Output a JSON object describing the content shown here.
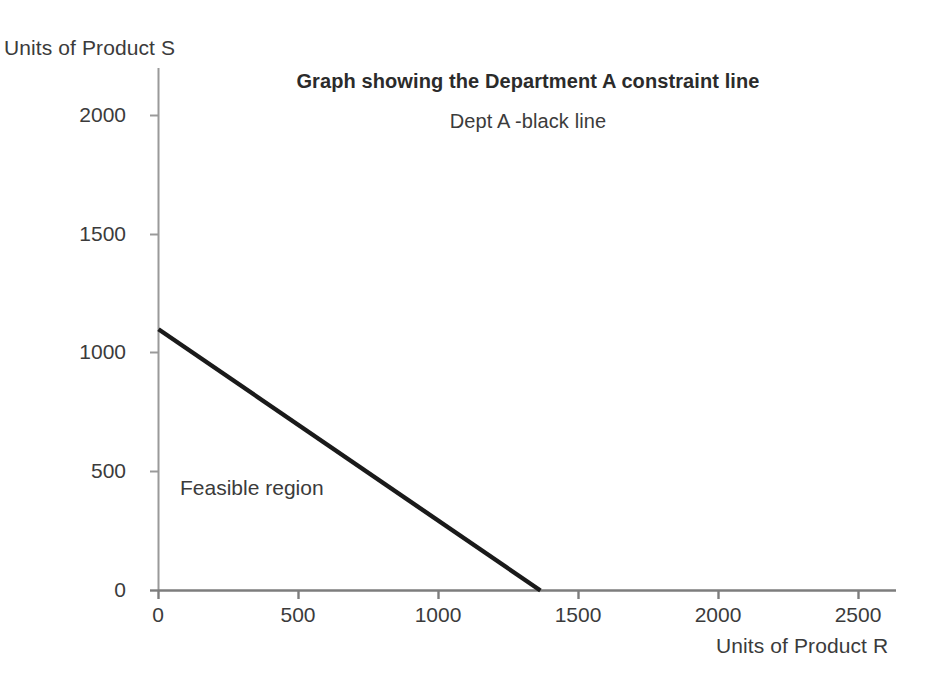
{
  "chart_data": {
    "type": "line",
    "title": "Graph showing the Department A constraint line",
    "subtitle": "Dept A -black line",
    "xlabel": "Units of Product R",
    "ylabel": "Units of Product S",
    "xlim": [
      0,
      2600
    ],
    "ylim": [
      0,
      2150
    ],
    "xticks": [
      0,
      500,
      1000,
      1500,
      2000,
      2500
    ],
    "yticks": [
      0,
      500,
      1000,
      1500,
      2000
    ],
    "xtick_labels": [
      "0",
      "500",
      "1000",
      "1500",
      "2000",
      "2500"
    ],
    "ytick_labels": [
      "0",
      "500",
      "1000",
      "1500",
      "2000"
    ],
    "grid": false,
    "legend": false,
    "series": [
      {
        "name": "Dept A constraint line",
        "color": "#1a1a1a",
        "x": [
          0,
          1364
        ],
        "values": [
          1100,
          0
        ]
      }
    ],
    "annotations": [
      {
        "text": "Feasible region",
        "x": 80,
        "y": 430
      }
    ],
    "axis_color": "#8c8c8c",
    "text_color": "#3b3b3b"
  },
  "ticks": {
    "y": {
      "t0": "0",
      "t1": "500",
      "t2": "1000",
      "t3": "1500",
      "t4": "2000"
    },
    "x": {
      "t0": "0",
      "t1": "500",
      "t2": "1000",
      "t3": "1500",
      "t4": "2000",
      "t5": "2500"
    }
  },
  "labels": {
    "title": "Graph showing the Department A constraint line",
    "subtitle": "Dept A -black line",
    "y_axis_title": "Units of Product S",
    "x_axis_title": "Units of Product R",
    "feasible_region": "Feasible region"
  }
}
